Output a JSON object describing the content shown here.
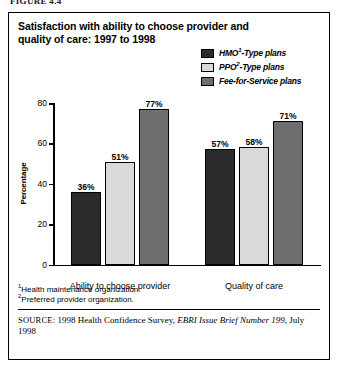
{
  "figure_caption": "FIGURE 4.4",
  "chart_title": "Satisfaction with ability to choose provider and quality of care: 1997 to 1998",
  "legend": [
    {
      "label": "HMO",
      "sup": "1",
      "label_tail": "-Type plans",
      "color": "#2b2b2b",
      "name": "hmo"
    },
    {
      "label": "PPO",
      "sup": "2",
      "label_tail": "-Type plans",
      "color": "#d9d9d9",
      "name": "ppo"
    },
    {
      "label": "Fee-for-Service plans",
      "sup": "",
      "label_tail": "",
      "color": "#6e6e6e",
      "name": "ffs"
    }
  ],
  "footnotes": [
    {
      "marker": "1",
      "text": "Health maintenance organization."
    },
    {
      "marker": "2",
      "text": "Preferred provider organization."
    }
  ],
  "source": {
    "kicker": "SOURCE:",
    "text_before": " 1998 Health Confidence Survey, ",
    "italic": "EBRI Issue Brief Number 199",
    "text_after": ", July 1998"
  },
  "chart_data": {
    "type": "bar",
    "title": "Satisfaction with ability to choose provider and quality of care: 1997 to 1998",
    "xlabel": "",
    "ylabel": "Percentage",
    "ylim": [
      0,
      80
    ],
    "yticks": [
      0,
      20,
      40,
      60,
      80
    ],
    "ytick_labels": [
      "0",
      "20",
      "40",
      "60",
      "80"
    ],
    "grid": false,
    "legend_position": "top-right",
    "value_suffix": "%",
    "categories": [
      "Ability to choose provider",
      "Quality of care"
    ],
    "series": [
      {
        "name": "HMO1-Type plans",
        "color": "#2b2b2b",
        "values": [
          36,
          57
        ],
        "labels": [
          "36%",
          "57%"
        ]
      },
      {
        "name": "PPO2-Type plans",
        "color": "#d9d9d9",
        "values": [
          51,
          58
        ],
        "labels": [
          "51%",
          "58%"
        ]
      },
      {
        "name": "Fee-for-Service plans",
        "color": "#6e6e6e",
        "values": [
          77,
          71
        ],
        "labels": [
          "77%",
          "71%"
        ]
      }
    ]
  }
}
